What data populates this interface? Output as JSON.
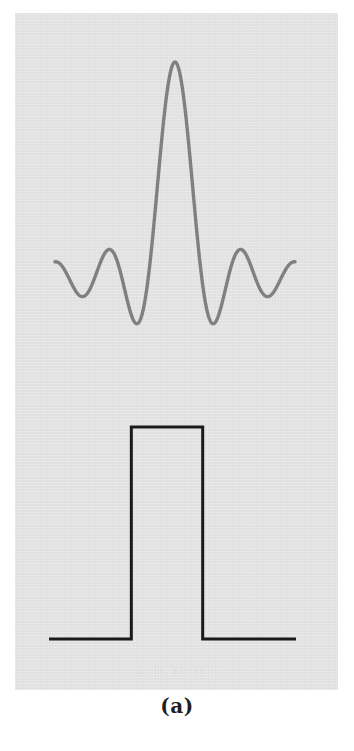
{
  "figure": {
    "caption": "(a)",
    "panel_color": "#e3e3e3",
    "page_color": "#ffffff",
    "ghost_text": "' '' '' '' '"
  },
  "chart_data": [
    {
      "type": "line",
      "name": "sinc-spectrum",
      "title": "",
      "subtitle": "",
      "xlabel": "",
      "ylabel": "",
      "xlim": [
        -4.5,
        4.5
      ],
      "ylim": [
        -0.25,
        1.05
      ],
      "grid": false,
      "legend": null,
      "axis_visible": false,
      "series": [
        {
          "name": "sinc(x)",
          "color": "#808080",
          "stroke_width": 3.4,
          "formula": "sin(pi*x)/(pi*x)",
          "x": [
            -4.5,
            -4.25,
            -4.0,
            -3.75,
            -3.5,
            -3.25,
            -3.0,
            -2.75,
            -2.5,
            -2.25,
            -2.0,
            -1.75,
            -1.5,
            -1.25,
            -1.0,
            -0.75,
            -0.5,
            -0.25,
            0.0,
            0.25,
            0.5,
            0.75,
            1.0,
            1.25,
            1.5,
            1.75,
            2.0,
            2.25,
            2.5,
            2.75,
            3.0,
            3.25,
            3.5,
            3.75,
            4.0,
            4.25,
            4.5
          ],
          "y": [
            -0.0707,
            -0.0935,
            0.0,
            0.1092,
            0.0909,
            0.0,
            -0.0642,
            -0.11,
            -0.1273,
            -0.11,
            0.0,
            0.1415,
            0.2122,
            0.1891,
            0.0,
            -0.3001,
            -0.6366,
            -0.9003,
            1.0,
            0.9003,
            0.6366,
            0.3001,
            0.0,
            -0.1891,
            -0.2122,
            -0.1415,
            0.0,
            0.11,
            0.1273,
            0.11,
            0.0,
            -0.0909,
            -0.1092,
            0.0,
            0.0707,
            0.0749,
            0.0
          ],
          "peak_value": 1.0,
          "peak_x": 0.0,
          "zero_crossings": [
            -4.0,
            -3.25,
            -2.0,
            -1.0,
            1.0,
            2.0,
            3.25,
            4.0
          ],
          "main_lobe_minima": [
            -0.2122,
            -0.2122
          ],
          "side_lobe_peaks": [
            0.2122,
            0.1273,
            0.0749
          ]
        }
      ]
    },
    {
      "type": "line",
      "name": "rectangular-pulse",
      "title": "",
      "subtitle": "",
      "xlabel": "",
      "ylabel": "",
      "xlim": [
        -4.5,
        4.5
      ],
      "ylim": [
        -0.08,
        1.12
      ],
      "grid": false,
      "legend": null,
      "axis_visible": false,
      "series": [
        {
          "name": "rect(x)",
          "color": "#1a1a1a",
          "stroke_width": 3.0,
          "formula": "rect(x/2)",
          "x": [
            -4.5,
            -1.5,
            -1.5,
            1.1,
            1.1,
            4.5
          ],
          "y": [
            0,
            0,
            1,
            1,
            0,
            0
          ],
          "pulse_height": 1.0,
          "pulse_left": -1.5,
          "pulse_right": 1.1,
          "baseline_value": 0
        }
      ]
    }
  ]
}
